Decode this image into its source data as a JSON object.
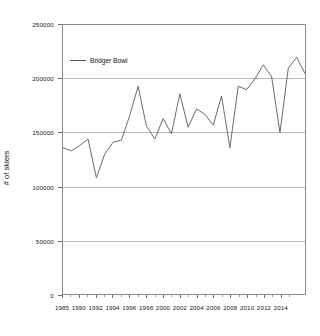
{
  "chart_data": {
    "type": "line",
    "title": "",
    "xlabel": "",
    "ylabel": "# of skiers",
    "ylim": [
      0,
      250000
    ],
    "ytick_values": [
      0,
      50000,
      100000,
      150000,
      200000,
      250000
    ],
    "ytick_labels": [
      "0",
      "50000",
      "100000",
      "150000",
      "200000",
      "250000"
    ],
    "xlim": [
      1986,
      2015
    ],
    "xtick_labels": [
      "1985",
      "1990",
      "1992",
      "1994",
      "1996",
      "1998",
      "2000",
      "2002",
      "2004",
      "2006",
      "2008",
      "2010",
      "2012",
      "2014"
    ],
    "grid": true,
    "legend_position": "upper-left-inside",
    "series": [
      {
        "name": "Bridger Bowl",
        "color": "#595959",
        "x": [
          1986,
          1987,
          1988,
          1989,
          1990,
          1991,
          1992,
          1993,
          1994,
          1995,
          1996,
          1997,
          1998,
          1999,
          2000,
          2001,
          2002,
          2003,
          2004,
          2005,
          2006,
          2007,
          2008,
          2009,
          2010,
          2011,
          2012,
          2013,
          2014,
          2015
        ],
        "values": [
          136000,
          133000,
          138000,
          144000,
          108000,
          130000,
          141000,
          143000,
          166000,
          193000,
          156000,
          144000,
          163000,
          149000,
          186000,
          155000,
          172000,
          167000,
          157000,
          184000,
          136000,
          193000,
          190000,
          200000,
          213000,
          202000,
          150000,
          210000,
          220000,
          205000
        ]
      }
    ]
  },
  "legend": {
    "label": "Bridger Bowl"
  },
  "axes": {
    "y_title": "# of skiers"
  }
}
